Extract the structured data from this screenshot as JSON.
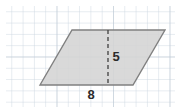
{
  "figure": {
    "type": "parallelogram-area-diagram",
    "canvas": {
      "width": 180,
      "height": 112,
      "background": "#ffffff"
    },
    "grid": {
      "visible": true,
      "cell_size": 11.3,
      "line_color": "#c8d2dc",
      "bold_line_color": "#b4c0cc",
      "area": {
        "x": 6,
        "y": 6,
        "width": 169,
        "height": 101
      }
    },
    "shape": {
      "name": "parallelogram",
      "fill_color": "#d4d4d4",
      "stroke_color": "#808080",
      "stroke_width": 1.4,
      "vertices": [
        {
          "x": 40,
          "y": 85
        },
        {
          "x": 72,
          "y": 30
        },
        {
          "x": 165,
          "y": 30
        },
        {
          "x": 133,
          "y": 85
        }
      ]
    },
    "height_line": {
      "name": "dashed-height-segment",
      "x": 108,
      "y_top": 30,
      "y_bottom": 85,
      "color": "#4a4a4a",
      "dash_pattern": "4 3",
      "stroke_width": 1.4
    },
    "labels": [
      {
        "id": "height-label",
        "text": "5",
        "x": 116,
        "y": 58,
        "describes": "height"
      },
      {
        "id": "base-label",
        "text": "8",
        "x": 91,
        "y": 96,
        "describes": "base"
      }
    ]
  }
}
